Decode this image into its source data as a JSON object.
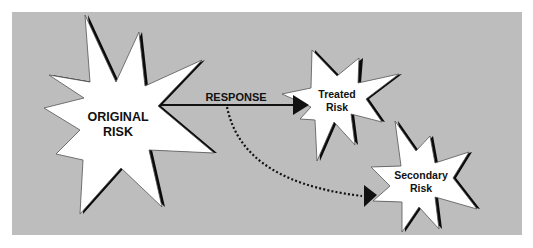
{
  "colors": {
    "background": "#ffffff",
    "panel": "#bdbdbd",
    "star_fill": "#ffffff",
    "star_shadow": "#0a0a0a",
    "star_outline": "#555555",
    "line": "#111111"
  },
  "nodes": [
    {
      "id": "original",
      "label_lines": [
        "ORIGINAL",
        "RISK"
      ]
    },
    {
      "id": "treated",
      "label_lines": [
        "Treated",
        "Risk"
      ]
    },
    {
      "id": "secondary",
      "label_lines": [
        "Secondary",
        "Risk"
      ]
    }
  ],
  "edges": [
    {
      "from": "original",
      "to": "treated",
      "label": "RESPONSE",
      "style": "solid"
    },
    {
      "from": "original",
      "to": "secondary",
      "label": "",
      "style": "dotted"
    }
  ]
}
